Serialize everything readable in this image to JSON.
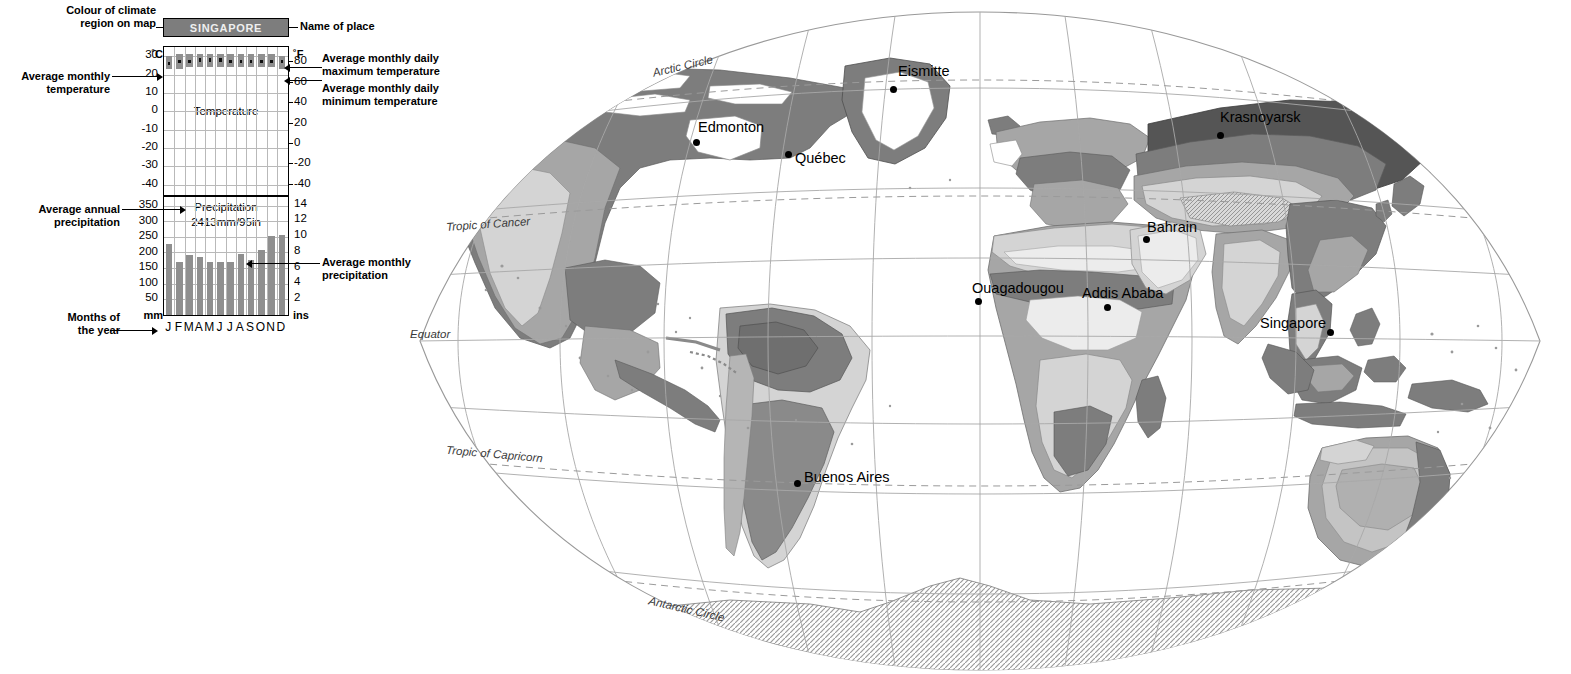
{
  "climate_graph": {
    "place_name": "SINGAPORE",
    "annotations": {
      "colour_of_region": "Colour of climate\nregion on map",
      "colour_of_region_l1": "Colour of climate",
      "colour_of_region_l2": "region on map",
      "name_of_place": "Name of place",
      "avg_monthly_temp_l1": "Average monthly",
      "avg_monthly_temp_l2": "temperature",
      "avg_daily_max_l1": "Average monthly daily",
      "avg_daily_max_l2": "maximum temperature",
      "avg_daily_min_l1": "Average monthly daily",
      "avg_daily_min_l2": "minimum temperature",
      "avg_annual_precip_l1": "Average annual",
      "avg_annual_precip_l2": "precipitation",
      "avg_monthly_precip_l1": "Average monthly",
      "avg_monthly_precip_l2": "precipitation",
      "months_of_year_l1": "Months of",
      "months_of_year_l2": "the year"
    },
    "units": {
      "celsius": "˚C",
      "fahrenheit": "˚F",
      "mm": "mm",
      "ins": "ins"
    },
    "pane_titles": {
      "temperature": "Temperature",
      "precipitation": "Precipitation"
    },
    "annual_precipitation_text": "2413mm/95in",
    "colors": {
      "bar_gray": "#8f8f8f",
      "header_gray": "#7d7d7d",
      "grid_gray": "#b9b9b9",
      "ink": "#000000"
    }
  },
  "chart_data": {
    "type": "bar",
    "title": "SINGAPORE",
    "categories": [
      "J",
      "F",
      "M",
      "A",
      "M",
      "J",
      "J",
      "A",
      "S",
      "O",
      "N",
      "D"
    ],
    "month_labels": [
      "J",
      "F",
      "M",
      "A",
      "M",
      "J",
      "J",
      "A",
      "S",
      "O",
      "N",
      "D"
    ],
    "xlabel": "Months of the year",
    "panels": [
      {
        "name": "temperature",
        "label": "Temperature",
        "ylabel": "˚C",
        "ylabel_right": "˚F",
        "ylim": [
          -45,
          35
        ],
        "yticks": [
          30,
          20,
          10,
          0,
          -10,
          -20,
          -30,
          -40
        ],
        "ytick_labels": [
          "30",
          "20",
          "10",
          "0",
          "-10",
          "-20",
          "-30",
          "-40"
        ],
        "yticks_right": [
          80,
          60,
          40,
          20,
          0,
          -20,
          -40
        ],
        "ytick_labels_right": [
          "80",
          "60",
          "40",
          "20",
          "0",
          "-20",
          "-40"
        ],
        "series": [
          {
            "name": "Average monthly daily maximum temperature",
            "values": [
              30,
              31,
              31,
              31,
              31,
              31,
              31,
              31,
              31,
              31,
              31,
              30
            ]
          },
          {
            "name": "Average monthly daily minimum temperature",
            "values": [
              23,
              23,
              24,
              24,
              24,
              24,
              24,
              24,
              24,
              24,
              24,
              23
            ]
          },
          {
            "name": "Average monthly temperature",
            "values": [
              26,
              27,
              27,
              28,
              28,
              28,
              27,
              27,
              27,
              27,
              27,
              27
            ]
          }
        ]
      },
      {
        "name": "precipitation",
        "label": "Precipitation",
        "ylabel": "mm",
        "ylabel_right": "ins",
        "ylim": [
          0,
          380
        ],
        "yticks": [
          350,
          300,
          250,
          200,
          150,
          100,
          50
        ],
        "ytick_labels": [
          "350",
          "300",
          "250",
          "200",
          "150",
          "100",
          "50"
        ],
        "yticks_right": [
          14,
          12,
          10,
          8,
          6,
          4,
          2
        ],
        "ytick_labels_right": [
          "14",
          "12",
          "10",
          "8",
          "6",
          "4",
          "2"
        ],
        "annual_total_mm": 2413,
        "annual_total_in": 95,
        "annual_total_text": "2413mm/95in",
        "series": [
          {
            "name": "Average monthly precipitation",
            "values": [
              228,
              172,
              193,
              188,
              172,
              172,
              170,
              196,
              178,
              208,
              254,
              257
            ]
          }
        ]
      }
    ],
    "grid": true,
    "legend_position": "none"
  },
  "map": {
    "cities": [
      {
        "name": "Eismitte",
        "label_x": 508,
        "label_y": 55,
        "dot_x": 500,
        "dot_y": 78,
        "align": "left"
      },
      {
        "name": "Edmonton",
        "label_x": 308,
        "label_y": 111,
        "dot_x": 303,
        "dot_y": 131,
        "align": "left"
      },
      {
        "name": "Québec",
        "label_x": 405,
        "label_y": 142,
        "dot_x": 395,
        "dot_y": 143,
        "align": "left"
      },
      {
        "name": "Krasnoyarsk",
        "label_x": 830,
        "label_y": 101,
        "dot_x": 827,
        "dot_y": 124,
        "align": "left"
      },
      {
        "name": "Bahrain",
        "label_x": 757,
        "label_y": 211,
        "dot_x": 753,
        "dot_y": 228,
        "align": "left"
      },
      {
        "name": "Ouagadougou",
        "label_x": 582,
        "label_y": 272,
        "dot_x": 585,
        "dot_y": 290,
        "align": "left"
      },
      {
        "name": "Addis Ababa",
        "label_x": 692,
        "label_y": 277,
        "dot_x": 714,
        "dot_y": 296,
        "align": "left"
      },
      {
        "name": "Singapore",
        "label_x": 870,
        "label_y": 307,
        "dot_x": 937,
        "dot_y": 321,
        "align": "left"
      },
      {
        "name": "Buenos Aires",
        "label_x": 414,
        "label_y": 461,
        "dot_x": 404,
        "dot_y": 472,
        "align": "left"
      }
    ],
    "geo_lines": [
      {
        "name": "Arctic Circle",
        "x": 262,
        "y": 52,
        "rotate": -13
      },
      {
        "name": "Tropic of Cancer",
        "x": 56,
        "y": 210,
        "rotate": -4
      },
      {
        "name": "Equator",
        "x": 20,
        "y": 320,
        "rotate": 0
      },
      {
        "name": "Tropic of Capricorn",
        "x": 56,
        "y": 440,
        "rotate": 5
      },
      {
        "name": "Antarctic Circle",
        "x": 258,
        "y": 595,
        "rotate": 13
      }
    ],
    "colors": {
      "ocean": "#ffffff",
      "graticule": "#a8a8a8",
      "tropic_dash": "#9a9a9a",
      "climate_dark": "#7d7d7d",
      "climate_mid": "#a6a6a6",
      "climate_light": "#d4d4d4",
      "climate_pale": "#ececec",
      "coast": "#555555"
    }
  }
}
